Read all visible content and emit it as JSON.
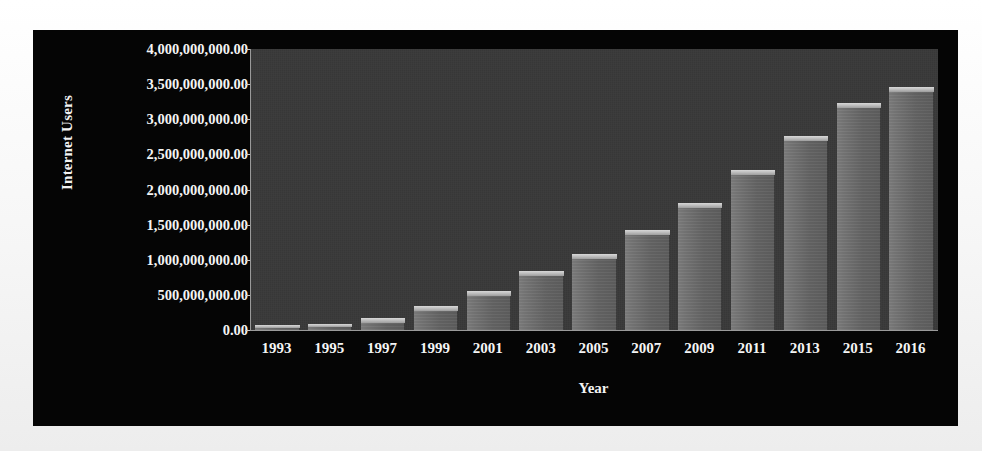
{
  "chart_data": {
    "type": "bar",
    "title": "",
    "xlabel": "Year",
    "ylabel": "Internet Users",
    "categories": [
      "1993",
      "1995",
      "1997",
      "1999",
      "2001",
      "2003",
      "2005",
      "2007",
      "2009",
      "2011",
      "2013",
      "2015",
      "2016"
    ],
    "values": [
      14000000,
      40000000,
      120000000,
      280000000,
      500000000,
      780000000,
      1030000000,
      1370000000,
      1750000000,
      2220000000,
      2710000000,
      3180000000,
      3400000000
    ],
    "ylim": [
      0,
      4000000000
    ],
    "ytick_values": [
      0,
      500000000,
      1000000000,
      1500000000,
      2000000000,
      2500000000,
      3000000000,
      3500000000,
      4000000000
    ],
    "ytick_labels": [
      "0.00",
      "500,000,000.00",
      "1,000,000,000.00",
      "1,500,000,000.00",
      "2,000,000,000.00",
      "2,500,000,000.00",
      "3,000,000,000.00",
      "3,500,000,000.00",
      "4,000,000,000.00"
    ],
    "grid": false,
    "legend": false,
    "legend_position": "none",
    "series": [
      {
        "name": "Internet Users",
        "values": [
          14000000,
          40000000,
          120000000,
          280000000,
          500000000,
          780000000,
          1030000000,
          1370000000,
          1750000000,
          2220000000,
          2710000000,
          3180000000,
          3400000000
        ]
      }
    ]
  },
  "style": {
    "panel_background": "#050505",
    "plot_background": "#393939",
    "bar_color": "#686868",
    "bar_top_color": "#c9c9c9",
    "axis_color": "#9a9a9a",
    "text_color": "#f4f4f4",
    "page_background": "#fbfbfb"
  }
}
